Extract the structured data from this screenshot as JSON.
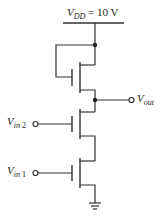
{
  "diagram": {
    "type": "circuit",
    "supply": {
      "symbol": "V",
      "subscript": "DD",
      "value_text": "= 10 V"
    },
    "output": {
      "symbol": "V",
      "subscript": "out"
    },
    "inputs": [
      {
        "symbol": "V",
        "subscript": "in",
        "index": "2"
      },
      {
        "symbol": "V",
        "subscript": "in",
        "index": "1"
      }
    ],
    "colors": {
      "wire": "#333333",
      "text": "#222222",
      "background": "#ffffff"
    },
    "components": [
      {
        "id": "load-transistor",
        "kind": "nmos",
        "connection": "gate tied to drain (VDD)"
      },
      {
        "id": "input-transistor-2",
        "kind": "nmos",
        "gate": "Vin2"
      },
      {
        "id": "input-transistor-1",
        "kind": "nmos",
        "gate": "Vin1"
      },
      {
        "id": "ground",
        "kind": "ground"
      }
    ]
  }
}
